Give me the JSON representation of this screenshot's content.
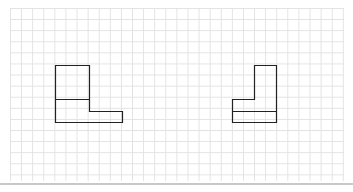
{
  "diagram": {
    "type": "orthographic-views-on-grid",
    "grid": {
      "cell_px": 11,
      "color": "#e2e2e2"
    },
    "stroke_color": "#222222",
    "shapes": [
      {
        "name": "left-view",
        "description": "L-shaped front view: tall square on left with extended step on bottom right"
      },
      {
        "name": "right-view",
        "description": "Mirrored L-shaped view: tall column on right with step on bottom left, horizontal line dividing bottom"
      }
    ]
  }
}
